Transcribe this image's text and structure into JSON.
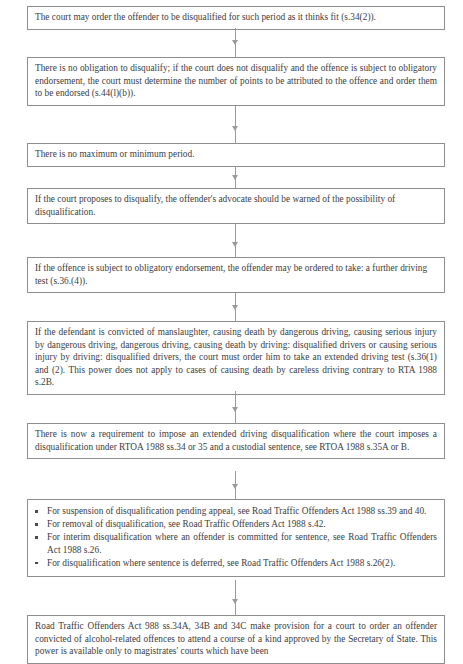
{
  "document": {
    "title": "Disqualification flowchart",
    "type": "flowchart",
    "accent_color": "#8e8e8e",
    "text_color": "#3d3d3d",
    "background_color": "#ffffff"
  },
  "nodes": [
    {
      "id": "node-1",
      "kind": "paragraph",
      "text": "The court may order the offender to be disqualified for such period as it thinks fit (s.34(2))."
    },
    {
      "id": "node-2",
      "kind": "paragraph",
      "text": "There is no obligation to disqualify; if the court does not disqualify and the offence is subject to obligatory endorsement, the court must determine the number of points to be attributed to the offence and order them to be endorsed (s.44(l)(b))."
    },
    {
      "id": "node-3",
      "kind": "paragraph",
      "text": "There is no maximum or minimum period."
    },
    {
      "id": "node-4",
      "kind": "paragraph",
      "text": "If the court proposes to disqualify, the offender's advocate should be warned of the possibility of disqualification."
    },
    {
      "id": "node-5",
      "kind": "paragraph",
      "text": "If the offence is subject to obligatory endorsement, the offender may be ordered to take: a further driving test (s.36.(4))."
    },
    {
      "id": "node-6",
      "kind": "paragraph",
      "text": "If the defendant is convicted of manslaughter, causing death by dangerous driving, causing serious injury by dangerous driving, dangerous driving, causing death by driving: disqualified drivers or causing serious injury by driving: disqualified drivers, the court must order him to take an extended driving test (s.36(1) and (2). This power does not apply to cases of causing death by careless driving contrary to RTA 1988 s.2B."
    },
    {
      "id": "node-7",
      "kind": "paragraph",
      "text": "There is now a requirement to impose an extended driving disqualification where the court imposes a disqualification under RTOA 1988 ss.34 or 35 and a custodial sentence, see RTOA 1988 s.35A or B."
    },
    {
      "id": "node-8",
      "kind": "bullets",
      "items": [
        "For suspension of disqualification pending appeal, see Road Traffic Offenders Act 1988 ss.39 and 40.",
        "For removal of disqualification, see Road Traffic Offenders Act 1988 s.42.",
        "For interim disqualification where an offender is committed for sentence, see Road Traffic Offenders Act 1988 s.26.",
        "For disqualification where sentence is deferred, see Road Traffic Offenders Act 1988 s.26(2)."
      ]
    },
    {
      "id": "node-9",
      "kind": "paragraph",
      "text": "Road Traffic Offenders Act 988 ss.34A, 34B and 34C make provision for a court to order an offender convicted of alcohol-related offences to attend a course of a kind approved by the Secretary of State. This power is available only to magistrates' courts which have been"
    }
  ],
  "connectors": [
    {
      "id": "connector-1-2",
      "from": "node-1",
      "to": "node-2"
    },
    {
      "id": "connector-2-3",
      "from": "node-2",
      "to": "node-3"
    },
    {
      "id": "connector-3-4",
      "from": "node-3",
      "to": "node-4"
    },
    {
      "id": "connector-4-5",
      "from": "node-4",
      "to": "node-5"
    },
    {
      "id": "connector-5-6",
      "from": "node-5",
      "to": "node-6"
    },
    {
      "id": "connector-6-7",
      "from": "node-6",
      "to": "node-7"
    },
    {
      "id": "connector-7-8",
      "from": "node-7",
      "to": "node-8"
    },
    {
      "id": "connector-8-9",
      "from": "node-8",
      "to": "node-9"
    }
  ]
}
